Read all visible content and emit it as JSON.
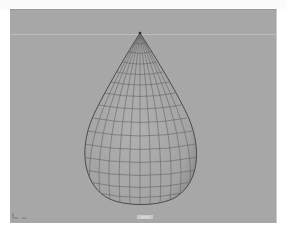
{
  "app": {
    "type": "3d-modeling-viewport"
  },
  "viewport": {
    "background_color": "#a7a7a7",
    "horizon_color": "#bcbcbc",
    "camera_label": "persp",
    "object": {
      "name": "teardrop-mesh",
      "display": "wireframe-on-shaded",
      "surface_color": "#a9a9a9",
      "wire_color": "#5e5e5e",
      "apex": [
        130,
        23
      ],
      "bulb_center": [
        130,
        140
      ],
      "bulb_radius_x": 60,
      "bulb_radius_y": 56,
      "bottom_y": 195
    },
    "axis_indicator": {
      "x_color": "#777777",
      "y_color": "#777777"
    }
  }
}
